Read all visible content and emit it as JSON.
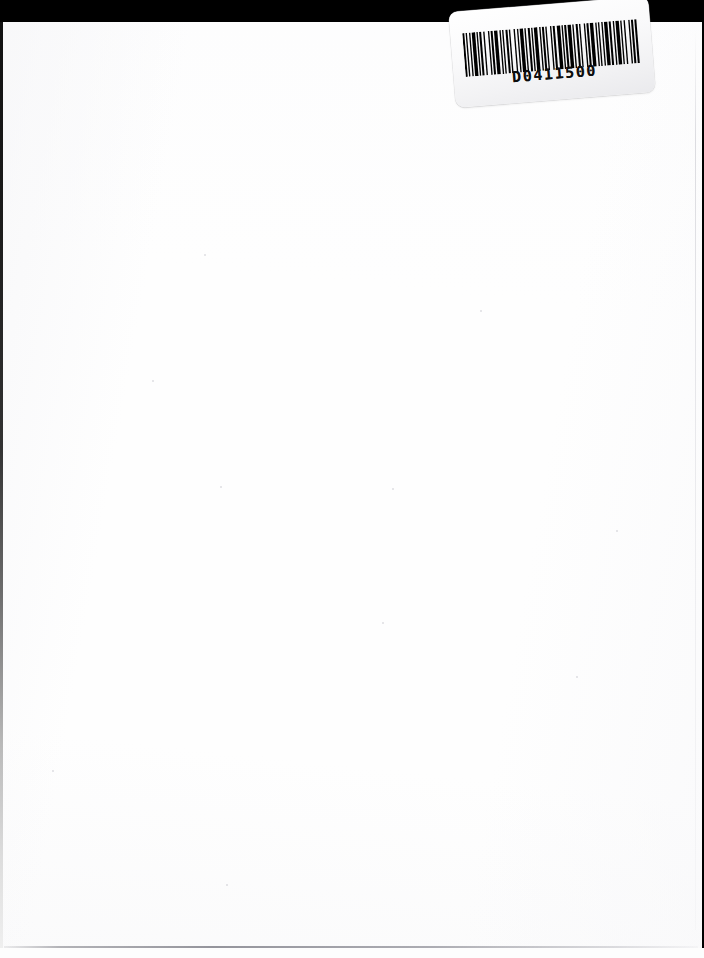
{
  "document": {
    "kind": "scanned-page",
    "page_state": "blank",
    "width": 704,
    "height": 958,
    "paper_color": "#fefefe",
    "backdrop_color": "#000000"
  },
  "label": {
    "name": "barcode-label",
    "barcode_number": "D0411500",
    "symbology": "Code 39",
    "rotation_degrees": -4.6,
    "label_color": "#fdfdfd",
    "bar_color": "#000000",
    "bar_pattern": [
      3,
      2,
      2,
      3,
      2,
      2,
      5,
      2,
      2,
      2,
      3,
      3,
      2,
      5,
      2,
      2,
      3,
      2,
      5,
      3,
      2,
      2,
      2,
      3,
      3,
      2,
      2,
      5,
      2,
      3,
      2,
      2,
      5,
      2,
      2,
      3,
      3,
      2,
      2,
      2,
      5,
      3,
      2,
      2,
      3,
      2,
      2,
      5,
      2,
      2,
      3,
      3,
      5,
      2,
      2,
      2,
      3,
      2,
      5,
      2,
      2,
      3,
      3,
      2,
      2,
      5,
      2,
      2,
      3,
      2,
      5,
      3,
      2,
      2,
      2,
      3,
      2,
      2,
      5,
      2,
      3,
      3,
      2,
      2,
      5,
      2,
      2,
      3,
      2,
      5,
      2,
      2,
      3,
      2,
      3,
      2
    ]
  },
  "artifacts": {
    "scanner_backdrop_band_height": 26,
    "left_gutter_width": 3,
    "bottom_edge_y": 946,
    "right_edge_x": 695,
    "specks": [
      {
        "x": 152,
        "y": 380,
        "size": 2
      },
      {
        "x": 480,
        "y": 310,
        "size": 2
      },
      {
        "x": 392,
        "y": 488,
        "size": 2
      },
      {
        "x": 220,
        "y": 486,
        "size": 2
      },
      {
        "x": 576,
        "y": 676,
        "size": 2
      },
      {
        "x": 52,
        "y": 770,
        "size": 2
      },
      {
        "x": 226,
        "y": 884,
        "size": 2
      },
      {
        "x": 382,
        "y": 622,
        "size": 2
      },
      {
        "x": 616,
        "y": 530,
        "size": 2
      },
      {
        "x": 204,
        "y": 254,
        "size": 2
      }
    ]
  }
}
